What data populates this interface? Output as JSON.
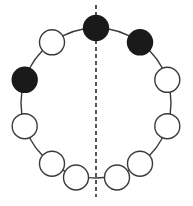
{
  "figure": {
    "name": "necklace-symmetry-diagram",
    "width": 193,
    "height": 206,
    "background_color": "#ffffff",
    "stroke_color": "#3a3a3a",
    "filled_bead_color": "#1a1a1a",
    "empty_bead_color": "#ffffff",
    "ring": {
      "center_x": 96,
      "center_y": 103,
      "radius": 75,
      "arc_stroke_width": 1.4
    },
    "axis": {
      "label": "axis-of-symmetry",
      "x": 96,
      "y_top": 5,
      "y_bottom": 197,
      "stroke_width": 1.6,
      "dash": "4 3",
      "color": "#2b2b2b"
    },
    "bead_radius": 12.5,
    "bead_stroke_width": 1.4,
    "bead_count": 10,
    "filled_count": 4,
    "empty_count": 6,
    "beads": [
      {
        "id": "bead-1",
        "label": "top",
        "angle_deg": -90,
        "cx": 96,
        "cy": 28,
        "fill": "filled",
        "on_axis": true
      },
      {
        "id": "bead-2",
        "label": "upper-right",
        "angle_deg": -54,
        "cx": 140,
        "cy": 42.3,
        "fill": "filled",
        "on_axis": false
      },
      {
        "id": "bead-3",
        "label": "right-upper",
        "angle_deg": -18,
        "cx": 167.3,
        "cy": 79.8,
        "fill": "empty",
        "on_axis": false
      },
      {
        "id": "bead-4",
        "label": "right-lower",
        "angle_deg": 18,
        "cx": 167.3,
        "cy": 126.2,
        "fill": "empty",
        "on_axis": false
      },
      {
        "id": "bead-5",
        "label": "bottom-right",
        "angle_deg": 54,
        "cx": 140,
        "cy": 163.7,
        "fill": "empty",
        "on_axis": false
      },
      {
        "id": "bead-6",
        "label": "bottom-left",
        "angle_deg": 126,
        "cx": 52,
        "cy": 163.7,
        "fill": "empty",
        "on_axis": false
      },
      {
        "id": "bead-7",
        "label": "left-lower",
        "angle_deg": 162,
        "cx": 24.7,
        "cy": 126.2,
        "fill": "empty",
        "on_axis": false
      },
      {
        "id": "bead-8",
        "label": "left-upper",
        "angle_deg": 198,
        "cx": 24.7,
        "cy": 79.8,
        "fill": "filled",
        "on_axis": false
      },
      {
        "id": "bead-9",
        "label": "upper-left",
        "angle_deg": 234,
        "cx": 52,
        "cy": 42.3,
        "fill": "empty",
        "on_axis": false
      },
      {
        "id": "bead-10",
        "label": "bottom-center-gap",
        "angle_deg": 90,
        "cx": 96,
        "cy": 178,
        "fill": "none",
        "on_axis": true
      }
    ],
    "bottom_pair": {
      "left": {
        "id": "bottom-bead-left",
        "cx": 76,
        "cy": 177.5,
        "fill": "empty"
      },
      "right": {
        "id": "bottom-bead-right",
        "cx": 117,
        "cy": 177.5,
        "fill": "empty"
      }
    }
  }
}
